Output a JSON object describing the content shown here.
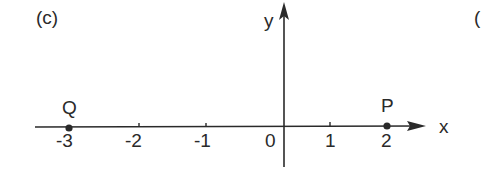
{
  "figure": {
    "panel_label": "(c)",
    "next_panel_partial": "(",
    "axes": {
      "x_label": "x",
      "y_label": "y"
    },
    "ticks": [
      {
        "value": -3,
        "label": "-3"
      },
      {
        "value": -2,
        "label": "-2"
      },
      {
        "value": -1,
        "label": "-1"
      },
      {
        "value": 0,
        "label": "0"
      },
      {
        "value": 1,
        "label": "1"
      },
      {
        "value": 2,
        "label": "2"
      }
    ],
    "points": [
      {
        "name": "Q",
        "x": -3,
        "y": 0
      },
      {
        "name": "P",
        "x": 2,
        "y": 0
      }
    ]
  },
  "colors": {
    "ink": "#2a2a2a",
    "background": "#ffffff"
  }
}
